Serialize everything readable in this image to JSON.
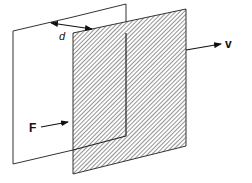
{
  "diagram": {
    "colors": {
      "line": "#333333",
      "hatch": "#555555",
      "background": "#ffffff"
    },
    "planes": [
      {
        "id": "stationary-plate",
        "fill": "none",
        "points": [
          [
            13,
            31
          ],
          [
            126,
            4
          ],
          [
            126,
            136
          ],
          [
            13,
            164
          ]
        ]
      },
      {
        "id": "moving-plate",
        "fill": "hatched",
        "points": [
          [
            73,
            33
          ],
          [
            186,
            9
          ],
          [
            186,
            146
          ],
          [
            73,
            174
          ]
        ]
      }
    ],
    "labels": {
      "distance": "d",
      "force": "F",
      "velocity": "v"
    },
    "arrows": {
      "distance": {
        "from": [
          50,
          23
        ],
        "to": [
          93,
          29
        ],
        "double_headed": true
      },
      "force": {
        "from": [
          41,
          127
        ],
        "to": [
          68,
          122
        ]
      },
      "velocity": {
        "from": [
          186,
          50
        ],
        "to": [
          221,
          44
        ]
      }
    }
  }
}
